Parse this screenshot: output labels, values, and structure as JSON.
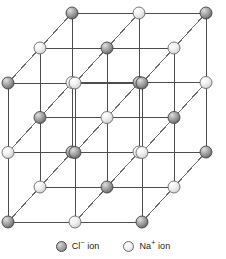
{
  "figure": {
    "type": "diagram",
    "projection": "oblique",
    "grid_dimensions": [
      3,
      3,
      3
    ],
    "background_color": "#ffffff"
  },
  "lattice": {
    "nodes_per_edge": 3,
    "cells_per_edge": 2,
    "origin": {
      "x": 8,
      "y": 222
    },
    "step_x": 67,
    "step_y": -69.5,
    "depth_dx": 32,
    "depth_dy": -35,
    "ion_radius": 6.0,
    "bond_color": "#4d4d4d",
    "bond_width": 1.0,
    "depth_bond_color": "#6b6b6b",
    "anion": {
      "symbol": "Cl",
      "charge": "minus",
      "name": "chloride",
      "fill_light": "#d8d8d8",
      "fill_mid": "#b0b0b0",
      "fill_dark": "#6e6e6e",
      "stroke": "#454545"
    },
    "cation": {
      "symbol": "Na",
      "charge": "plus",
      "name": "sodium",
      "fill_light": "#ffffff",
      "fill_mid": "#ebebeb",
      "fill_dark": "#c9c9c9",
      "stroke": "#6b6b6b"
    }
  },
  "legend": {
    "items": [
      {
        "id": "chloride",
        "marker": "chloride-sphere",
        "species": "Cl",
        "charge": "−",
        "suffix": " ion",
        "label": "Cl− ion"
      },
      {
        "id": "sodium",
        "marker": "sodium-sphere",
        "species": "Na",
        "charge": "+",
        "suffix": " ion",
        "label": "Na+ ion"
      }
    ]
  }
}
